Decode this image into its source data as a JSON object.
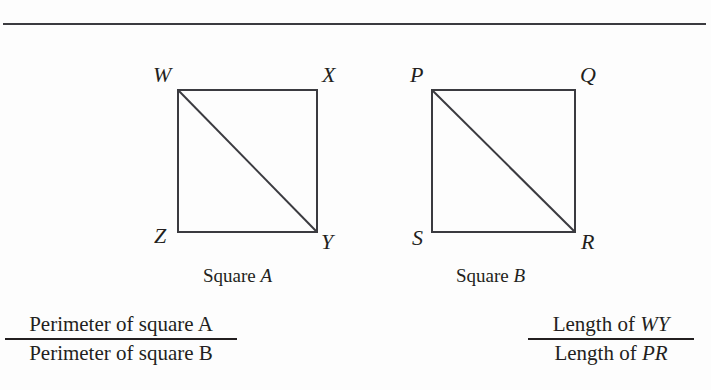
{
  "document": {
    "top_rule": "horizontal-rule"
  },
  "figures": [
    {
      "id": "square-a",
      "caption_prefix": "Square ",
      "caption_name": "A",
      "vertices": [
        {
          "name": "top-left",
          "label": "W"
        },
        {
          "name": "top-right",
          "label": "X"
        },
        {
          "name": "bottom-left",
          "label": "Z"
        },
        {
          "name": "bottom-right",
          "label": "Y"
        }
      ],
      "diagonal": "W to Y"
    },
    {
      "id": "square-b",
      "caption_prefix": "Square ",
      "caption_name": "B",
      "vertices": [
        {
          "name": "top-left",
          "label": "P"
        },
        {
          "name": "top-right",
          "label": "Q"
        },
        {
          "name": "bottom-left",
          "label": "S"
        },
        {
          "name": "bottom-right",
          "label": "R"
        }
      ],
      "diagonal": "P to R"
    }
  ],
  "expressions": [
    {
      "id": "perimeter-ratio",
      "numerator_text": "Perimeter of square ",
      "numerator_term": "A",
      "denominator_text": "Perimeter of square ",
      "denominator_term": "B"
    },
    {
      "id": "diagonal-length-ratio",
      "numerator_text": "Length of ",
      "numerator_term": "WY",
      "denominator_text": "Length of ",
      "denominator_term": "PR"
    }
  ],
  "colors": {
    "ink": "#231f20",
    "rule": "#3b3b40",
    "page": "#fdfdfd"
  }
}
